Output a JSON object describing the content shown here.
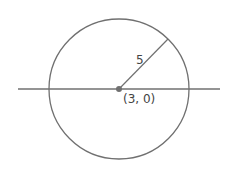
{
  "diagram": {
    "type": "circle-with-radius",
    "center_label": "(3, 0)",
    "radius_label": "5",
    "colors": {
      "stroke": "#707070",
      "center_dot": "#707070",
      "text": "#444444",
      "background": "#ffffff"
    }
  }
}
